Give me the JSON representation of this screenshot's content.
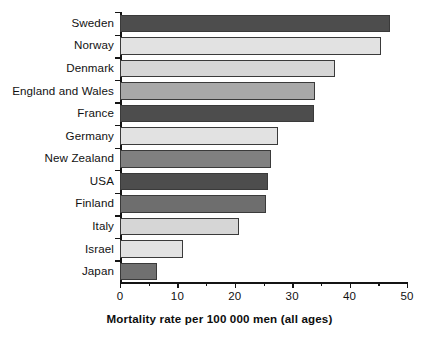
{
  "chart_data": {
    "type": "bar",
    "orientation": "horizontal",
    "title": "",
    "xlabel": "Mortality rate per 100 000 men (all ages)",
    "ylabel": "",
    "xlim": [
      0,
      50
    ],
    "xticks": [
      0,
      10,
      20,
      30,
      40,
      50
    ],
    "xtick_labels": [
      "0",
      "10",
      "20",
      "30",
      "40",
      "50"
    ],
    "grid": false,
    "legend": null,
    "categories": [
      "Sweden",
      "Norway",
      "Denmark",
      "England and Wales",
      "France",
      "Germany",
      "New Zealand",
      "USA",
      "Finland",
      "Italy",
      "Israel",
      "Japan"
    ],
    "values": [
      47.0,
      45.5,
      37.5,
      34.0,
      33.8,
      27.5,
      26.3,
      25.8,
      25.5,
      20.8,
      11.0,
      6.4
    ],
    "bar_colors": [
      "#4d4d4d",
      "#e2e2e2",
      "#d6d6d6",
      "#a8a8a8",
      "#4d4d4d",
      "#e2e2e2",
      "#808080",
      "#4d4d4d",
      "#6e6e6e",
      "#d6d6d6",
      "#e2e2e2",
      "#707070"
    ],
    "bar_edge_color": "#3a3a3a",
    "axis_color": "#141414",
    "background": "#ffffff"
  }
}
